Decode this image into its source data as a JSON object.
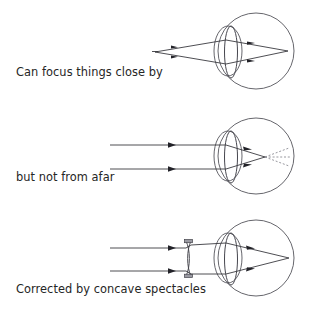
{
  "figure": {
    "background_color": "#ffffff",
    "ink_color": "#3a3a40",
    "text_color": "#262626",
    "dashed_ray_color": "#7d7d86",
    "panels": [
      {
        "id": "panel-near-vision",
        "caption": "Can focus things close by",
        "caption_x": 16,
        "caption_y": 76,
        "source": "near point source",
        "has_spectacles": false,
        "has_dashed_rays": false,
        "focus": "on retina"
      },
      {
        "id": "panel-distant-vision",
        "caption": "but not from afar",
        "caption_x": 16,
        "caption_y": 181,
        "source": "parallel rays from distance",
        "has_spectacles": false,
        "has_dashed_rays": true,
        "focus": "in front of retina"
      },
      {
        "id": "panel-corrected-vision",
        "caption": "Corrected by concave spectacles",
        "caption_x": 16,
        "caption_y": 293,
        "source": "parallel rays from distance",
        "has_spectacles": true,
        "has_dashed_rays": false,
        "focus": "on retina"
      }
    ],
    "eye_parts": {
      "eyeball": "eyeball-circle",
      "cornea": "cornea-bulge",
      "lens": "crystalline-lens",
      "retina": "retina-point"
    },
    "spectacle_lens": {
      "name": "concave-spectacle-lens",
      "shape": "biconcave"
    }
  }
}
